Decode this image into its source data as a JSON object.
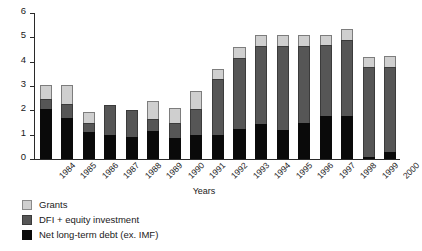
{
  "chart_data": {
    "type": "bar",
    "stacked": true,
    "title": "",
    "xlabel": "Years",
    "ylabel": "",
    "ylim": [
      0,
      6
    ],
    "yticks": [
      0,
      1,
      2,
      3,
      4,
      5,
      6
    ],
    "grid": false,
    "legend_position": "bottom-left",
    "categories": [
      "1984",
      "1985",
      "1986",
      "1987",
      "1988",
      "1989",
      "1990",
      "1991",
      "1992",
      "1993",
      "1994",
      "1995",
      "1996",
      "1997",
      "1998",
      "1999",
      "2000"
    ],
    "series": [
      {
        "name": "Net long-term debt (ex. IMF)",
        "color": "#0a0a0a",
        "values": [
          2.05,
          1.7,
          1.1,
          1.0,
          0.9,
          1.15,
          0.85,
          1.0,
          1.0,
          1.25,
          1.45,
          1.2,
          1.5,
          1.75,
          1.75,
          0.1,
          0.3
        ]
      },
      {
        "name": "DFI + equity investment",
        "color": "#565656",
        "values": [
          0.4,
          0.55,
          0.4,
          1.2,
          1.1,
          0.5,
          0.65,
          1.05,
          2.3,
          2.9,
          3.2,
          3.45,
          3.15,
          2.95,
          3.15,
          3.7,
          3.5
        ]
      },
      {
        "name": "Grants",
        "color": "#cfcfcf",
        "values": [
          0.6,
          0.8,
          0.45,
          0.0,
          0.0,
          0.75,
          0.6,
          0.75,
          0.4,
          0.45,
          0.45,
          0.45,
          0.45,
          0.4,
          0.45,
          0.4,
          0.45
        ]
      }
    ]
  },
  "legend": {
    "items": [
      {
        "label": "Grants",
        "swatch": "grants"
      },
      {
        "label": "DFI + equity investment",
        "swatch": "dfi"
      },
      {
        "label": "Net long-term debt (ex. IMF)",
        "swatch": "debt"
      }
    ]
  }
}
